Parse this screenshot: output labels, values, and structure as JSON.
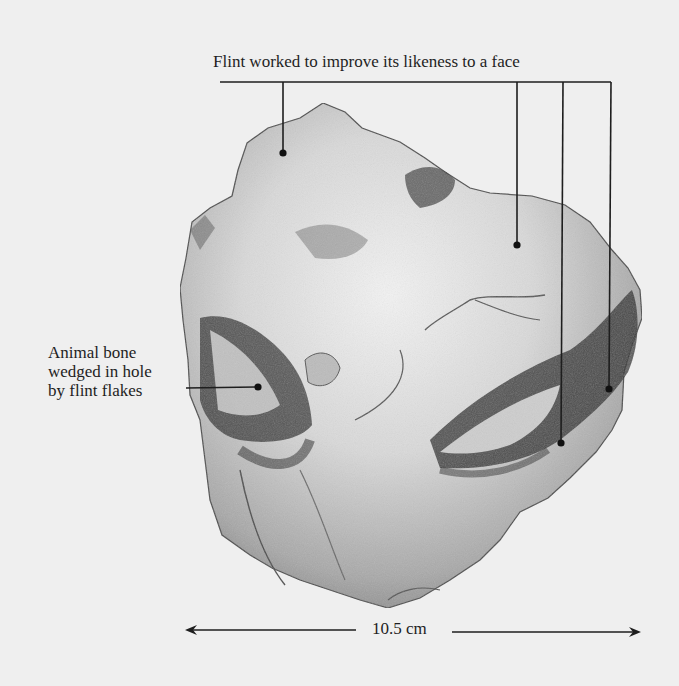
{
  "figure": {
    "annotations": {
      "top": {
        "text": "Flint worked to improve its likeness to a face",
        "targets": [
          {
            "x": 283,
            "y": 153
          },
          {
            "x": 517,
            "y": 245
          },
          {
            "x": 561,
            "y": 443
          },
          {
            "x": 609,
            "y": 389
          }
        ]
      },
      "left": {
        "lines": [
          "Animal bone",
          "wedged in hole",
          "by flint flakes"
        ],
        "target": {
          "x": 258,
          "y": 387
        }
      }
    },
    "scale": {
      "label": "10.5 cm",
      "arrow_left_x": 185,
      "arrow_right_x": 641,
      "y": 631
    },
    "colors": {
      "background": "#efefef",
      "ink": "#1e1e1e",
      "stone_light": "#e4e4e4",
      "stone_mid": "#a8a8a8",
      "stone_dark": "#3a3a3a"
    }
  }
}
